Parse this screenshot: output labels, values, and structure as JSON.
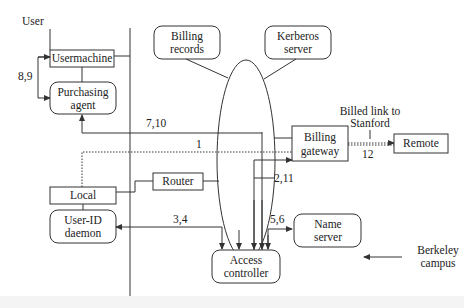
{
  "diagram": {
    "nodes": {
      "user": "User",
      "usermachine": "Usermachine",
      "purchasing_agent": [
        "Purchasing",
        "agent"
      ],
      "billing_records": [
        "Billing",
        "records"
      ],
      "kerberos_server": [
        "Kerberos",
        "server"
      ],
      "billing_gateway": [
        "Billing",
        "gateway"
      ],
      "remote": "Remote",
      "local": "Local",
      "router": "Router",
      "user_id_daemon": [
        "User-ID",
        "daemon"
      ],
      "access_controller": [
        "Access",
        "controller"
      ],
      "name_server": [
        "Name",
        "server"
      ]
    },
    "annotations": {
      "billed_link": [
        "Billed link to",
        "Stanford"
      ],
      "berkeley_campus": [
        "Berkeley",
        "campus"
      ]
    },
    "edge_labels": {
      "e89": "8,9",
      "e710": "7,10",
      "e1": "1",
      "e211": "2,11",
      "e12": "12",
      "e34": "3,4",
      "e56": "5,6"
    }
  }
}
